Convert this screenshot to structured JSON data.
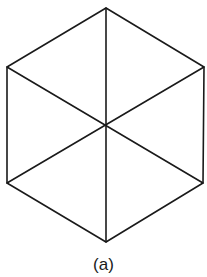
{
  "figure": {
    "caption": "(a)",
    "stroke_color": "#1a1a1a",
    "background": "#ffffff",
    "shape": "regular hexagon divided into six triangles by three diagonals through center",
    "vertices": {
      "top": [
        106,
        8
      ],
      "upper_right": [
        204,
        67
      ],
      "lower_right": [
        203,
        183
      ],
      "bottom": [
        106,
        242
      ],
      "lower_left": [
        7,
        183
      ],
      "upper_left": [
        7,
        67
      ],
      "center": [
        106,
        125
      ]
    }
  }
}
